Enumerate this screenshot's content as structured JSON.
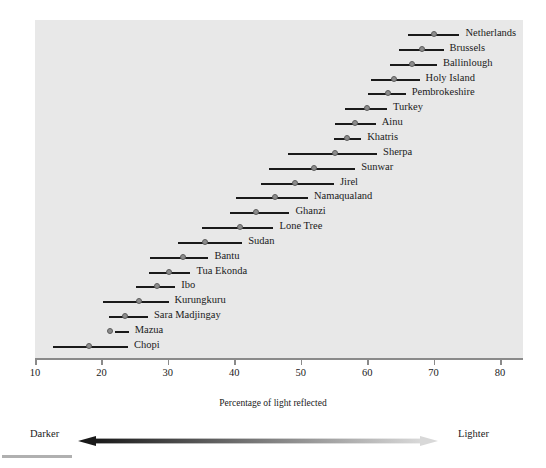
{
  "chart_data": {
    "type": "range",
    "title": "",
    "xlabel": "Percentage of light reflected",
    "ylabel": "",
    "xlim": [
      10,
      80
    ],
    "xticks": [
      10,
      20,
      30,
      40,
      50,
      60,
      70,
      80
    ],
    "xtick_labels": [
      "10",
      "20",
      "30",
      "40",
      "50",
      "60",
      "70",
      "80"
    ],
    "grid": false,
    "legend_position": "below-axis",
    "point_color": "#8c8c8c",
    "line_color": "#1a1a1a",
    "panel_color": "#e8e8e8",
    "categories": [
      "Netherlands",
      "Brussels",
      "Ballinlough",
      "Holy Island",
      "Pembrokeshire",
      "Turkey",
      "Ainu",
      "Khatris",
      "Sherpa",
      "Sunwar",
      "Jirel",
      "Namaqualand",
      "Ghanzi",
      "Lone Tree",
      "Sudan",
      "Bantu",
      "Tua Ekonda",
      "Ibo",
      "Kurungkuru",
      "Sara Madjingay",
      "Mazua",
      "Chopi"
    ],
    "series": [
      {
        "name": "Netherlands",
        "low": 66.2,
        "value": 70.1,
        "high": 73.9
      },
      {
        "name": "Brussels",
        "low": 64.8,
        "value": 68.2,
        "high": 71.5
      },
      {
        "name": "Ballinlough",
        "low": 63.4,
        "value": 66.7,
        "high": 70.5
      },
      {
        "name": "Holy Island",
        "low": 60.6,
        "value": 64.1,
        "high": 67.9
      },
      {
        "name": "Pembrokeshire",
        "low": 60.2,
        "value": 63.1,
        "high": 65.8
      },
      {
        "name": "Turkey",
        "low": 56.6,
        "value": 60.0,
        "high": 63.0
      },
      {
        "name": "Ainu",
        "low": 55.1,
        "value": 58.2,
        "high": 61.3
      },
      {
        "name": "Khatris",
        "low": 55.0,
        "value": 57.0,
        "high": 59.1
      },
      {
        "name": "Sherpa",
        "low": 48.1,
        "value": 55.1,
        "high": 61.5
      },
      {
        "name": "Sunwar",
        "low": 45.3,
        "value": 52.0,
        "high": 58.2
      },
      {
        "name": "Jirel",
        "low": 44.0,
        "value": 49.2,
        "high": 55.0
      },
      {
        "name": "Namaqualand",
        "low": 40.2,
        "value": 46.2,
        "high": 51.1
      },
      {
        "name": "Ghanzi",
        "low": 39.3,
        "value": 43.3,
        "high": 48.3
      },
      {
        "name": "Lone Tree",
        "low": 35.2,
        "value": 40.9,
        "high": 45.9
      },
      {
        "name": "Sudan",
        "low": 31.5,
        "value": 35.6,
        "high": 41.2
      },
      {
        "name": "Bantu",
        "low": 27.3,
        "value": 32.3,
        "high": 36.1
      },
      {
        "name": "Tua Ekonda",
        "low": 27.1,
        "value": 30.2,
        "high": 33.4
      },
      {
        "name": "Ibo",
        "low": 25.2,
        "value": 28.3,
        "high": 31.1
      },
      {
        "name": "Kurungkuru",
        "low": 20.3,
        "value": 25.7,
        "high": 30.1
      },
      {
        "name": "Sara Madjingay",
        "low": 21.1,
        "value": 23.5,
        "high": 27.0
      },
      {
        "name": "Mazua",
        "low": 22.1,
        "value": 21.3,
        "high": 24.1
      },
      {
        "name": "Chopi",
        "low": 12.7,
        "value": 18.1,
        "high": 24.0
      }
    ]
  },
  "axis": {
    "title": "Percentage of light reflected"
  },
  "legend": {
    "left_label": "Darker",
    "right_label": "Lighter",
    "dark_color": "#1a1a1a",
    "light_color": "#d8d8d8"
  }
}
